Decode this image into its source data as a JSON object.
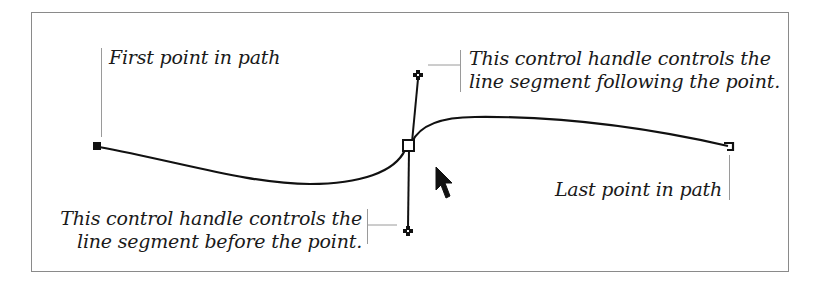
{
  "diagram": {
    "type": "bezier-path-illustration",
    "colors": {
      "stroke": "#111111",
      "frame": "#8a8a8a",
      "leader": "#9a9a9a",
      "text": "#1a1a1a"
    },
    "labels": {
      "first_point": "First point in path",
      "following_handle_line1": "This control handle controls the",
      "following_handle_line2": "line segment following the point.",
      "before_handle_line1": "This control handle controls the",
      "before_handle_line2": "line segment before the point.",
      "last_point": "Last point in path"
    },
    "elements": {
      "first_anchor": "first-point-square",
      "middle_anchor": "selected-anchor-square",
      "top_handle": "control-handle-following",
      "bottom_handle": "control-handle-before",
      "last_anchor": "last-point-square",
      "cursor": "arrow-pointer-icon"
    }
  }
}
